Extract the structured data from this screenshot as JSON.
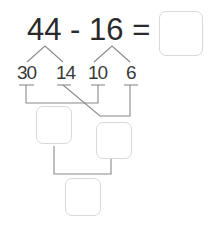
{
  "problem": {
    "left_operand": "44",
    "operator": "-",
    "right_operand": "16",
    "equals": "=",
    "answer": ""
  },
  "decomposition": {
    "left_parts": [
      "30",
      "14"
    ],
    "right_parts": [
      "10",
      "6"
    ]
  },
  "answer_boxes": {
    "result": "",
    "step1": "",
    "step2": "",
    "final": ""
  },
  "colors": {
    "text": "#2a2a2a",
    "lines": "#8a8a8a",
    "box_border": "#d9d9d9"
  }
}
